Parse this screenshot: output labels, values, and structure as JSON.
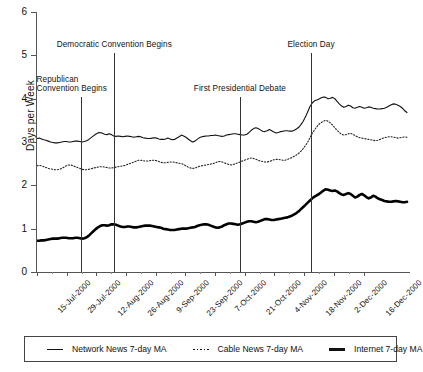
{
  "chart_data": {
    "type": "line",
    "title": "",
    "xlabel": "",
    "ylabel": "Days per Week",
    "ylim": [
      0,
      6
    ],
    "yticks": [
      0,
      1,
      2,
      3,
      4,
      5,
      6
    ],
    "grid": false,
    "legend_position": "bottom",
    "xtick_labels": [
      "15-Jul-2000",
      "29-Jul-2000",
      "12-Aug-2000",
      "26-Aug-2000",
      "9-Sep-2000",
      "23-Sep-2000",
      "7-Oct-2000",
      "21-Oct-2000",
      "4-Nov-2000",
      "18-Nov-2000",
      "2-Dec-2000",
      "16-Dec-2000"
    ],
    "x_range": [
      "15-Jul-2000",
      "23-Dec-2000"
    ],
    "annotations": [
      {
        "label": "Republican\nConvention Begins",
        "label_line1": "Republican",
        "label_line2": "Convention Begins",
        "x_date": "31-Jul-2000",
        "x_frac": 0.1176
      },
      {
        "label": "Democratic Convention Begins",
        "label_line1": "Democratic Convention Begins",
        "label_line2": "",
        "x_date": "14-Aug-2000",
        "x_frac": 0.2086
      },
      {
        "label": "First Presidential Debate",
        "label_line1": "First Presidential Debate",
        "label_line2": "",
        "x_date": "3-Oct-2000",
        "x_frac": 0.5481
      },
      {
        "label": "Election Day",
        "label_line1": "Election Day",
        "label_line2": "",
        "x_date": "7-Nov-2000",
        "x_frac": 0.7406
      }
    ],
    "series": [
      {
        "name": "Network News 7-day MA",
        "style": "thin-solid",
        "color": "#111111",
        "values": [
          3.08,
          3.09,
          3.07,
          3.05,
          3.04,
          3.02,
          3.0,
          2.99,
          2.98,
          2.98,
          2.99,
          3.0,
          3.01,
          3.01,
          3.0,
          3.0,
          3.01,
          3.02,
          3.02,
          3.01,
          3.0,
          3.01,
          3.03,
          3.06,
          3.1,
          3.14,
          3.18,
          3.21,
          3.22,
          3.2,
          3.18,
          3.17,
          3.19,
          3.17,
          3.14,
          3.13,
          3.14,
          3.13,
          3.12,
          3.13,
          3.14,
          3.13,
          3.12,
          3.11,
          3.12,
          3.13,
          3.12,
          3.1,
          3.09,
          3.08,
          3.08,
          3.09,
          3.1,
          3.09,
          3.07,
          3.06,
          3.06,
          3.07,
          3.09,
          3.07,
          3.05,
          3.06,
          3.09,
          3.12,
          3.16,
          3.14,
          3.11,
          3.07,
          3.03,
          3.0,
          3.02,
          3.06,
          3.1,
          3.12,
          3.13,
          3.14,
          3.14,
          3.15,
          3.15,
          3.16,
          3.15,
          3.14,
          3.13,
          3.14,
          3.16,
          3.17,
          3.18,
          3.19,
          3.19,
          3.18,
          3.17,
          3.16,
          3.16,
          3.18,
          3.22,
          3.27,
          3.31,
          3.33,
          3.31,
          3.28,
          3.25,
          3.24,
          3.26,
          3.29,
          3.26,
          3.23,
          3.21,
          3.22,
          3.24,
          3.25,
          3.26,
          3.26,
          3.25,
          3.25,
          3.27,
          3.3,
          3.34,
          3.4,
          3.48,
          3.58,
          3.7,
          3.82,
          3.9,
          3.95,
          3.97,
          3.99,
          4.02,
          4.04,
          4.03,
          4.0,
          4.01,
          4.03,
          4.0,
          3.94,
          3.88,
          3.83,
          3.8,
          3.82,
          3.85,
          3.83,
          3.79,
          3.78,
          3.8,
          3.82,
          3.8,
          3.78,
          3.79,
          3.81,
          3.8,
          3.78,
          3.77,
          3.76,
          3.76,
          3.77,
          3.78,
          3.8,
          3.83,
          3.86,
          3.88,
          3.87,
          3.85,
          3.82,
          3.78,
          3.72,
          3.68
        ]
      },
      {
        "name": "Cable News 7-day MA",
        "style": "dotted",
        "color": "#222222",
        "values": [
          2.45,
          2.46,
          2.45,
          2.43,
          2.41,
          2.39,
          2.38,
          2.37,
          2.36,
          2.36,
          2.37,
          2.39,
          2.42,
          2.45,
          2.47,
          2.47,
          2.45,
          2.43,
          2.41,
          2.39,
          2.37,
          2.36,
          2.36,
          2.37,
          2.38,
          2.4,
          2.41,
          2.42,
          2.43,
          2.43,
          2.42,
          2.41,
          2.4,
          2.4,
          2.41,
          2.42,
          2.43,
          2.44,
          2.45,
          2.46,
          2.48,
          2.5,
          2.52,
          2.54,
          2.56,
          2.58,
          2.58,
          2.57,
          2.56,
          2.56,
          2.57,
          2.58,
          2.58,
          2.57,
          2.55,
          2.53,
          2.52,
          2.52,
          2.53,
          2.54,
          2.54,
          2.53,
          2.52,
          2.51,
          2.5,
          2.48,
          2.45,
          2.42,
          2.4,
          2.39,
          2.4,
          2.42,
          2.44,
          2.45,
          2.46,
          2.47,
          2.48,
          2.49,
          2.5,
          2.52,
          2.54,
          2.55,
          2.54,
          2.52,
          2.5,
          2.48,
          2.47,
          2.48,
          2.5,
          2.52,
          2.54,
          2.56,
          2.58,
          2.6,
          2.62,
          2.63,
          2.62,
          2.6,
          2.58,
          2.56,
          2.55,
          2.54,
          2.54,
          2.55,
          2.57,
          2.59,
          2.6,
          2.6,
          2.59,
          2.58,
          2.58,
          2.6,
          2.62,
          2.64,
          2.67,
          2.7,
          2.74,
          2.79,
          2.85,
          2.92,
          3.0,
          3.1,
          3.2,
          3.28,
          3.35,
          3.41,
          3.45,
          3.48,
          3.5,
          3.48,
          3.44,
          3.39,
          3.33,
          3.27,
          3.22,
          3.18,
          3.16,
          3.17,
          3.19,
          3.2,
          3.18,
          3.15,
          3.12,
          3.1,
          3.09,
          3.08,
          3.07,
          3.06,
          3.05,
          3.04,
          3.03,
          3.04,
          3.06,
          3.08,
          3.1,
          3.11,
          3.12,
          3.12,
          3.11,
          3.1,
          3.09,
          3.1,
          3.11,
          3.12,
          3.11
        ]
      },
      {
        "name": "Internet 7-day MA",
        "style": "thick-solid",
        "color": "#000000",
        "values": [
          0.72,
          0.72,
          0.73,
          0.73,
          0.74,
          0.75,
          0.76,
          0.77,
          0.77,
          0.77,
          0.78,
          0.79,
          0.79,
          0.79,
          0.78,
          0.78,
          0.78,
          0.79,
          0.79,
          0.78,
          0.77,
          0.78,
          0.8,
          0.84,
          0.89,
          0.94,
          0.99,
          1.03,
          1.06,
          1.08,
          1.08,
          1.07,
          1.08,
          1.1,
          1.1,
          1.09,
          1.07,
          1.05,
          1.04,
          1.04,
          1.05,
          1.05,
          1.04,
          1.03,
          1.03,
          1.04,
          1.05,
          1.06,
          1.07,
          1.07,
          1.07,
          1.06,
          1.05,
          1.04,
          1.03,
          1.02,
          1.0,
          0.99,
          0.98,
          0.97,
          0.97,
          0.97,
          0.98,
          0.99,
          1.0,
          1.0,
          1.0,
          1.01,
          1.02,
          1.03,
          1.04,
          1.06,
          1.08,
          1.09,
          1.1,
          1.1,
          1.09,
          1.07,
          1.05,
          1.03,
          1.02,
          1.03,
          1.05,
          1.08,
          1.1,
          1.12,
          1.12,
          1.11,
          1.1,
          1.09,
          1.1,
          1.12,
          1.14,
          1.16,
          1.17,
          1.17,
          1.16,
          1.15,
          1.16,
          1.18,
          1.2,
          1.22,
          1.22,
          1.21,
          1.2,
          1.2,
          1.21,
          1.22,
          1.23,
          1.24,
          1.25,
          1.26,
          1.28,
          1.3,
          1.33,
          1.36,
          1.4,
          1.45,
          1.5,
          1.55,
          1.6,
          1.65,
          1.7,
          1.74,
          1.77,
          1.8,
          1.84,
          1.88,
          1.91,
          1.9,
          1.88,
          1.87,
          1.88,
          1.86,
          1.82,
          1.79,
          1.78,
          1.8,
          1.82,
          1.8,
          1.76,
          1.72,
          1.74,
          1.78,
          1.8,
          1.77,
          1.73,
          1.7,
          1.72,
          1.76,
          1.74,
          1.7,
          1.68,
          1.66,
          1.64,
          1.63,
          1.62,
          1.62,
          1.63,
          1.64,
          1.63,
          1.62,
          1.61,
          1.61,
          1.62
        ]
      }
    ]
  },
  "legend": {
    "items": [
      {
        "label": "Network News 7-day MA",
        "swatch": "thin-line-swatch"
      },
      {
        "label": "Cable News 7-day MA",
        "swatch": "dotted-line-swatch"
      },
      {
        "label": "Internet 7-day MA",
        "swatch": "thick-line-swatch"
      }
    ]
  }
}
